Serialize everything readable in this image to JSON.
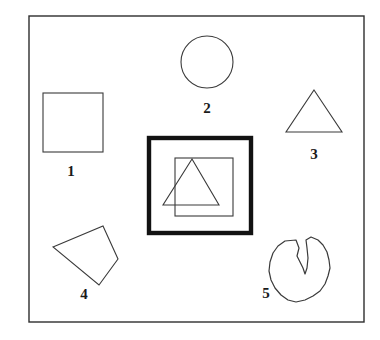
{
  "figure": {
    "background_color": "#ffffff",
    "line_color": "#3a3a3a",
    "bold_line_color": "#121212",
    "label_color": "#1a1a1a",
    "outer_frame": {
      "x": 29,
      "y": 16,
      "width": 335,
      "height": 306
    },
    "shapes": [
      {
        "id": "shape-1",
        "label": "1",
        "kind": "square",
        "label_x": 71,
        "label_y": 176,
        "geometry": {
          "x": 43,
          "y": 93,
          "width": 60,
          "height": 59
        }
      },
      {
        "id": "shape-2",
        "label": "2",
        "kind": "circle",
        "label_x": 207,
        "label_y": 113,
        "geometry": {
          "cx": 207,
          "cy": 62,
          "r": 26
        }
      },
      {
        "id": "shape-3",
        "label": "3",
        "kind": "triangle",
        "label_x": 314,
        "label_y": 159,
        "geometry": {
          "points": "314,90 342,132 286,132"
        }
      },
      {
        "id": "shape-4",
        "label": "4",
        "kind": "quadrilateral",
        "label_x": 84,
        "label_y": 299,
        "geometry": {
          "points": "53,247 103,226 118,259 99,285"
        }
      },
      {
        "id": "shape-5",
        "label": "5",
        "kind": "notched-blob",
        "label_x": 266,
        "label_y": 298,
        "geometry": {
          "points": "296,240 299,248 297,256 300,262 303,268 305,274 307,268 308,258 307,248 306,240 311,237 318,240 323,245 327,252 329,260 330,268 328,276 325,284 320,291 313,296 305,300 296,302 288,300 281,295 275,288 271,280 269,271 270,262 273,253 278,246 285,241"
        }
      }
    ],
    "group_box": {
      "id": "group-box",
      "kind": "bold-framed-group",
      "frame": {
        "x": 149,
        "y": 138,
        "width": 102,
        "height": 95
      },
      "inner_square": {
        "x": 175,
        "y": 158,
        "width": 58,
        "height": 58
      },
      "inner_triangle": {
        "points": "192,159 219,205 163,205"
      }
    }
  }
}
